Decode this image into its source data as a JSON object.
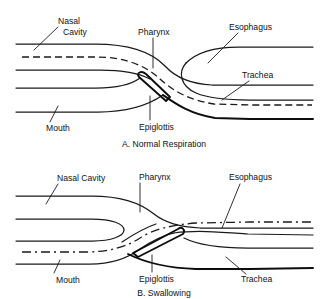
{
  "figure": {
    "background_color": "#ffffff",
    "line_color": "#1a1a1a",
    "panels": [
      {
        "id": "panel-a",
        "caption": "A. Normal Respiration",
        "labels": {
          "nasal_cavity_line1": "Nasal",
          "nasal_cavity_line2": "Cavity",
          "pharynx": "Pharynx",
          "esophagus": "Esophagus",
          "trachea": "Trachea",
          "mouth": "Mouth",
          "epiglottis": "Epiglottis"
        },
        "flow_path": "air travels from nasal cavity through pharynx into trachea",
        "flow_style": "dashed",
        "epiglottis_state": "upright, airway open"
      },
      {
        "id": "panel-b",
        "caption": "B. Swallowing",
        "labels": {
          "nasal_cavity": "Nasal Cavity",
          "pharynx": "Pharynx",
          "esophagus": "Esophagus",
          "trachea": "Trachea",
          "mouth": "Mouth",
          "epiglottis": "Epiglottis"
        },
        "flow_path": "food travels from mouth through pharynx into esophagus",
        "flow_style": "dash-dot",
        "epiglottis_state": "tilted back, trachea closed"
      }
    ]
  }
}
